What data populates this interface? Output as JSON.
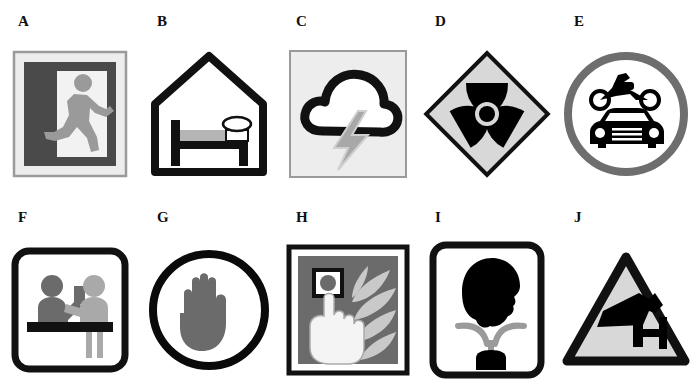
{
  "sheet": {
    "title": "Safety and information pictogram sheet",
    "rows": 2,
    "columns": 5,
    "background_color": "#ffffff",
    "label_color": "#101010"
  },
  "palette": {
    "black": "#000000",
    "near_black": "#111111",
    "dark_gray": "#4a4a4a",
    "mid_gray": "#707070",
    "light_gray": "#d8d8d8",
    "pale_gray": "#ededed",
    "white": "#ffffff",
    "circle_gray": "#6e6e6e",
    "flame_gray": "#c9c9c9"
  },
  "items": [
    {
      "label": "A",
      "icon_name": "emergency-exit-running-man-icon",
      "meaning": "Emergency exit",
      "shape": "square",
      "colors": {
        "frame": "#9a9a9a",
        "panel": "#ededed",
        "field": "#4a4a4a",
        "door": "#f2f2f2",
        "figure": "#9a9a9a"
      }
    },
    {
      "label": "B",
      "icon_name": "hotel-accommodation-bed-house-icon",
      "meaning": "Accommodation / hotel",
      "shape": "house-outline",
      "colors": {
        "outline": "#111111",
        "mattress": "#b5b5b5",
        "pillow": "#ffffff"
      }
    },
    {
      "label": "C",
      "icon_name": "thunderstorm-cloud-lightning-icon",
      "meaning": "Thunderstorm / lightning hazard",
      "shape": "square",
      "colors": {
        "panel": "#ededed",
        "border": "#9a9a9a",
        "cloud": "#111111",
        "bolt": "#a8a8a8"
      }
    },
    {
      "label": "D",
      "icon_name": "radiation-trefoil-icon",
      "meaning": "Ionising radiation",
      "shape": "diamond",
      "colors": {
        "field": "#d8d8d8",
        "border": "#111111",
        "trefoil": "#000000"
      }
    },
    {
      "label": "E",
      "icon_name": "motor-vehicles-motorcycle-car-icon",
      "meaning": "Motor vehicles",
      "shape": "circle",
      "colors": {
        "ring": "#6e6e6e",
        "field": "#ffffff",
        "vehicles": "#000000"
      }
    },
    {
      "label": "F",
      "icon_name": "reception-information-desk-icon",
      "meaning": "Reception / information desk",
      "shape": "rounded-square",
      "colors": {
        "border": "#111111",
        "field": "#ffffff",
        "figure_dark": "#6b6b6b",
        "figure_light": "#a9a9a9",
        "counter": "#111111"
      }
    },
    {
      "label": "G",
      "icon_name": "stop-hand-palm-icon",
      "meaning": "Stop / do not enter",
      "shape": "circle",
      "colors": {
        "ring": "#0a0a0a",
        "field": "#ffffff",
        "hand": "#6b6b6b"
      }
    },
    {
      "label": "H",
      "icon_name": "fire-alarm-call-point-icon",
      "meaning": "Fire alarm call point",
      "shape": "square",
      "colors": {
        "border": "#111111",
        "field": "#6b6b6b",
        "button_box": "#111111",
        "hand": "#f4f4f4",
        "flames": "#c9c9c9"
      }
    },
    {
      "label": "I",
      "icon_name": "eye-wash-station-icon",
      "meaning": "Eyewash station",
      "shape": "rounded-square",
      "colors": {
        "border": "#111111",
        "field": "#ffffff",
        "head": "#000000",
        "water": "#9a9a9a",
        "basin": "#000000"
      }
    },
    {
      "label": "J",
      "icon_name": "cctv-surveillance-camera-icon",
      "meaning": "CCTV in operation",
      "shape": "triangle",
      "colors": {
        "border": "#111111",
        "field": "#d8d8d8",
        "camera": "#000000"
      }
    }
  ]
}
